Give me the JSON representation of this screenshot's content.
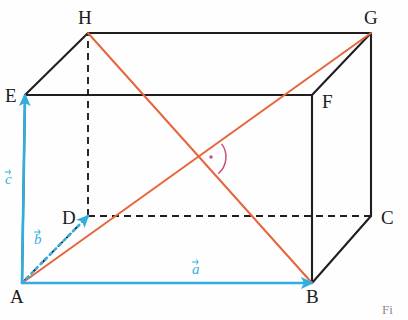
{
  "figure": {
    "caption": "Fi",
    "colors": {
      "edge_solid": "#1f1f1f",
      "edge_hidden": "#1f1f1f",
      "diagonal": "#e8643c",
      "vector": "#33adde",
      "angle_mark": "#c2527a",
      "background": "#fefefe"
    },
    "vertices": [
      {
        "name": "A",
        "x": 22,
        "y": 283,
        "label_x": 10,
        "label_y": 287,
        "hidden": false
      },
      {
        "name": "B",
        "x": 312,
        "y": 283,
        "label_x": 306,
        "label_y": 287,
        "hidden": false
      },
      {
        "name": "C",
        "x": 371,
        "y": 216,
        "label_x": 381,
        "label_y": 208,
        "hidden": false
      },
      {
        "name": "D",
        "x": 88,
        "y": 216,
        "label_x": 62,
        "label_y": 208,
        "hidden": true
      },
      {
        "name": "E",
        "x": 25,
        "y": 95,
        "label_x": 5,
        "label_y": 86,
        "hidden": false
      },
      {
        "name": "F",
        "x": 312,
        "y": 95,
        "label_x": 322,
        "label_y": 92,
        "hidden": false
      },
      {
        "name": "G",
        "x": 371,
        "y": 33,
        "label_x": 364,
        "label_y": 8,
        "hidden": false
      },
      {
        "name": "H",
        "x": 88,
        "y": 33,
        "label_x": 78,
        "label_y": 8,
        "hidden": false
      }
    ],
    "solid_edges": [
      {
        "from": "A",
        "to": "B"
      },
      {
        "from": "B",
        "to": "C"
      },
      {
        "from": "C",
        "to": "G"
      },
      {
        "from": "G",
        "to": "H"
      },
      {
        "from": "H",
        "to": "E"
      },
      {
        "from": "E",
        "to": "F"
      },
      {
        "from": "F",
        "to": "G"
      },
      {
        "from": "F",
        "to": "B"
      },
      {
        "from": "E",
        "to": "A"
      }
    ],
    "hidden_edges": [
      {
        "from": "D",
        "to": "H"
      },
      {
        "from": "D",
        "to": "C"
      },
      {
        "from": "D",
        "to": "A"
      }
    ],
    "diagonals": [
      {
        "name": "HB",
        "from": "H",
        "to": "B",
        "arrow": false
      },
      {
        "name": "AG",
        "from": "A",
        "to": "G",
        "arrow": false
      }
    ],
    "angle_marker": {
      "at_x": 204,
      "at_y": 157,
      "label": "",
      "dot": true
    },
    "vectors": [
      {
        "name": "a",
        "label": "a",
        "from": "A",
        "to": "B",
        "style": "solid",
        "label_x": 192,
        "label_y": 262
      },
      {
        "name": "b",
        "label": "b",
        "from": "A",
        "to": "D",
        "style": "dotted",
        "label_x": 34,
        "label_y": 232
      },
      {
        "name": "c",
        "label": "c",
        "from": "A",
        "to": "E",
        "style": "solid",
        "label_x": 5,
        "label_y": 172
      }
    ]
  }
}
